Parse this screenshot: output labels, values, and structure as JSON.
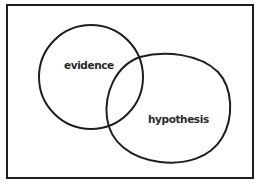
{
  "diagram": {
    "type": "venn",
    "sets": [
      {
        "id": "evidence",
        "label": "evidence"
      },
      {
        "id": "hypothesis",
        "label": "hypothesis"
      }
    ],
    "colors": {
      "stroke": "#1e1e1e",
      "text": "#2a2a2a",
      "background": "#ffffff"
    }
  }
}
